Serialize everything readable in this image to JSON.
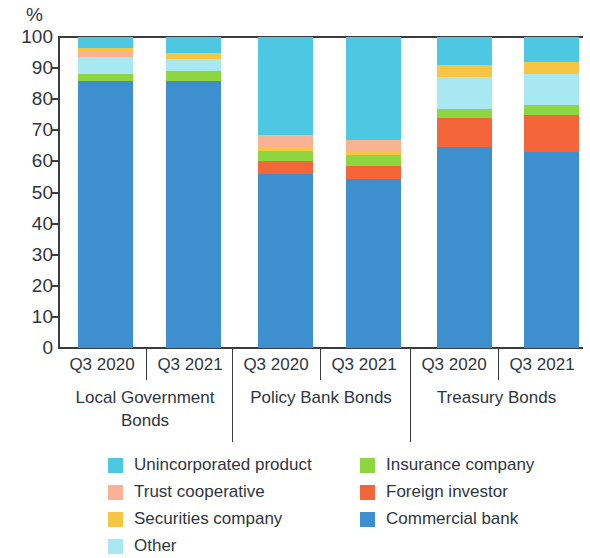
{
  "chart_data": {
    "type": "bar",
    "stacked": true,
    "stack_mode": "percent",
    "title": "",
    "subtitle": "",
    "xlabel": "",
    "ylabel": "%",
    "ylim": [
      0,
      100
    ],
    "ytick_labels": [
      "100",
      "90",
      "80",
      "70",
      "60",
      "50",
      "40",
      "30",
      "20",
      "10",
      "0"
    ],
    "ytick_values": [
      100,
      90,
      80,
      70,
      60,
      50,
      40,
      30,
      20,
      10,
      0
    ],
    "grid": false,
    "legend_position": "bottom",
    "categories": [
      "Q3 2020",
      "Q3 2021",
      "Q3 2020",
      "Q3 2021",
      "Q3 2020",
      "Q3 2021"
    ],
    "group_labels": [
      "Local Government Bonds",
      "Policy Bank Bonds",
      "Treasury Bonds"
    ],
    "groups": [
      {
        "label": "Local Government Bonds",
        "label_line1": "Local Government",
        "label_line2": "Bonds",
        "categories": [
          "Q3 2020",
          "Q3 2021"
        ]
      },
      {
        "label": "Policy Bank Bonds",
        "label_line1": "Policy Bank Bonds",
        "label_line2": "",
        "categories": [
          "Q3 2020",
          "Q3 2021"
        ]
      },
      {
        "label": "Treasury Bonds",
        "label_line1": "Treasury Bonds",
        "label_line2": "",
        "categories": [
          "Q3 2020",
          "Q3 2021"
        ]
      }
    ],
    "series": [
      {
        "name": "Commercial bank",
        "color": "#3d8fce",
        "values": [
          86,
          86,
          56,
          54.5,
          64.5,
          63
        ]
      },
      {
        "name": "Foreign investor",
        "color": "#f4663a",
        "values": [
          0,
          0,
          4,
          4,
          9.5,
          12
        ]
      },
      {
        "name": "Insurance company",
        "color": "#8ed63f",
        "values": [
          2,
          3,
          3.5,
          3.5,
          3,
          3
        ]
      },
      {
        "name": "Securities company",
        "color": "#f8c443",
        "values": [
          1,
          2,
          1,
          1,
          4,
          4
        ]
      },
      {
        "name": "Trust cooperative",
        "color": "#f9b293",
        "values": [
          2,
          0,
          4,
          4,
          0,
          0
        ]
      },
      {
        "name": "Other",
        "color": "#a8e8f2",
        "values": [
          5.5,
          4,
          0,
          0,
          10,
          10
        ]
      },
      {
        "name": "Unincorporated product",
        "color": "#4cc8e3",
        "values": [
          3.5,
          5,
          31.5,
          33,
          9,
          8
        ]
      }
    ],
    "stack_order_bottom_to_top": [
      "Commercial bank",
      "Foreign investor",
      "Insurance company",
      "Securities company",
      "Trust cooperative",
      "Other",
      "Unincorporated product"
    ],
    "bars": [
      {
        "group": "Local Government Bonds",
        "category": "Q3 2020",
        "segments": [
          {
            "name": "Commercial bank",
            "value": 86,
            "color": "#3d8fce"
          },
          {
            "name": "Insurance company",
            "value": 2,
            "color": "#8ed63f"
          },
          {
            "name": "Other",
            "value": 5.5,
            "color": "#a8e8f2"
          },
          {
            "name": "Trust cooperative",
            "value": 2,
            "color": "#f9b293"
          },
          {
            "name": "Securities company",
            "value": 1,
            "color": "#f8c443"
          },
          {
            "name": "Unincorporated product",
            "value": 3.5,
            "color": "#4cc8e3"
          }
        ]
      },
      {
        "group": "Local Government Bonds",
        "category": "Q3 2021",
        "segments": [
          {
            "name": "Commercial bank",
            "value": 86,
            "color": "#3d8fce"
          },
          {
            "name": "Insurance company",
            "value": 3,
            "color": "#8ed63f"
          },
          {
            "name": "Other",
            "value": 4,
            "color": "#a8e8f2"
          },
          {
            "name": "Securities company",
            "value": 2,
            "color": "#f8c443"
          },
          {
            "name": "Unincorporated product",
            "value": 5,
            "color": "#4cc8e3"
          }
        ]
      },
      {
        "group": "Policy Bank Bonds",
        "category": "Q3 2020",
        "segments": [
          {
            "name": "Commercial bank",
            "value": 56,
            "color": "#3d8fce"
          },
          {
            "name": "Foreign investor",
            "value": 4,
            "color": "#f4663a"
          },
          {
            "name": "Insurance company",
            "value": 3.5,
            "color": "#8ed63f"
          },
          {
            "name": "Securities company",
            "value": 1,
            "color": "#f8c443"
          },
          {
            "name": "Trust cooperative",
            "value": 4,
            "color": "#f9b293"
          },
          {
            "name": "Unincorporated product",
            "value": 31.5,
            "color": "#4cc8e3"
          }
        ]
      },
      {
        "group": "Policy Bank Bonds",
        "category": "Q3 2021",
        "segments": [
          {
            "name": "Commercial bank",
            "value": 54.5,
            "color": "#3d8fce"
          },
          {
            "name": "Foreign investor",
            "value": 4,
            "color": "#f4663a"
          },
          {
            "name": "Insurance company",
            "value": 3.5,
            "color": "#8ed63f"
          },
          {
            "name": "Securities company",
            "value": 1,
            "color": "#f8c443"
          },
          {
            "name": "Trust cooperative",
            "value": 4,
            "color": "#f9b293"
          },
          {
            "name": "Unincorporated product",
            "value": 33,
            "color": "#4cc8e3"
          }
        ]
      },
      {
        "group": "Treasury Bonds",
        "category": "Q3 2020",
        "segments": [
          {
            "name": "Commercial bank",
            "value": 64.5,
            "color": "#3d8fce"
          },
          {
            "name": "Foreign investor",
            "value": 9.5,
            "color": "#f4663a"
          },
          {
            "name": "Insurance company",
            "value": 3,
            "color": "#8ed63f"
          },
          {
            "name": "Other",
            "value": 10,
            "color": "#a8e8f2"
          },
          {
            "name": "Securities company",
            "value": 4,
            "color": "#f8c443"
          },
          {
            "name": "Unincorporated product",
            "value": 9,
            "color": "#4cc8e3"
          }
        ]
      },
      {
        "group": "Treasury Bonds",
        "category": "Q3 2021",
        "segments": [
          {
            "name": "Commercial bank",
            "value": 63,
            "color": "#3d8fce"
          },
          {
            "name": "Foreign investor",
            "value": 12,
            "color": "#f4663a"
          },
          {
            "name": "Insurance company",
            "value": 3,
            "color": "#8ed63f"
          },
          {
            "name": "Other",
            "value": 10,
            "color": "#a8e8f2"
          },
          {
            "name": "Securities company",
            "value": 4,
            "color": "#f8c443"
          },
          {
            "name": "Unincorporated product",
            "value": 8,
            "color": "#4cc8e3"
          }
        ]
      }
    ],
    "legend": {
      "left_column": [
        {
          "label": "Unincorporated product",
          "color": "#4cc8e3"
        },
        {
          "label": "Trust cooperative",
          "color": "#f9b293"
        },
        {
          "label": "Securities company",
          "color": "#f8c443"
        },
        {
          "label": "Other",
          "color": "#a8e8f2"
        }
      ],
      "right_column": [
        {
          "label": "Insurance company",
          "color": "#8ed63f"
        },
        {
          "label": "Foreign investor",
          "color": "#f4663a"
        },
        {
          "label": "Commercial bank",
          "color": "#3d8fce"
        }
      ]
    }
  }
}
